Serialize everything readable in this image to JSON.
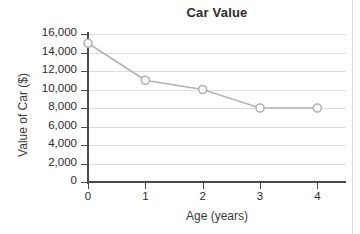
{
  "chart_data": {
    "type": "line",
    "title": "Car Value",
    "xlabel": "Age (years)",
    "ylabel": "Value of Car ($)",
    "x": [
      0,
      1,
      2,
      3,
      4
    ],
    "values": [
      15000,
      11000,
      10000,
      8000,
      8000
    ],
    "series": [
      {
        "name": "Car Value",
        "x": [
          0,
          1,
          2,
          3,
          4
        ],
        "values": [
          15000,
          11000,
          10000,
          8000,
          8000
        ]
      }
    ],
    "xlim": [
      0,
      4.5
    ],
    "ylim": [
      0,
      16000
    ],
    "x_ticks": [
      0,
      1,
      2,
      3,
      4
    ],
    "x_tick_labels": [
      "0",
      "1",
      "2",
      "3",
      "4"
    ],
    "y_ticks": [
      0,
      2000,
      4000,
      6000,
      8000,
      10000,
      12000,
      14000,
      16000
    ],
    "y_tick_labels": [
      "0",
      "2,000",
      "4,000",
      "6,000",
      "8,000",
      "10,000",
      "12,000",
      "14,000",
      "16,000"
    ],
    "grid": "horizontal",
    "legend": "none",
    "marker": "open-circle",
    "colors": {
      "line": "#b3b3b3",
      "marker_stroke": "#b3b3b3",
      "marker_fill": "#ffffff",
      "gridline": "#dedede",
      "axis": "#4a4a4a",
      "text": "#2b2b2b",
      "background": "#ffffff"
    }
  }
}
